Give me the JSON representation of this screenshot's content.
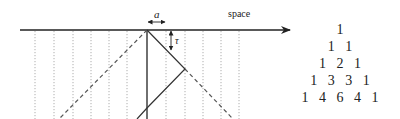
{
  "diagram": {
    "axis_label": "space",
    "spacing_label": "a",
    "time_label": "τ",
    "colors": {
      "line": "#333333",
      "dotted": "#999999",
      "dashed": "#555555"
    }
  },
  "pascal_triangle": {
    "rows": [
      "1",
      "1   1",
      "1   2   1",
      "1   3   3   1",
      "1   4   6   4   1"
    ]
  }
}
